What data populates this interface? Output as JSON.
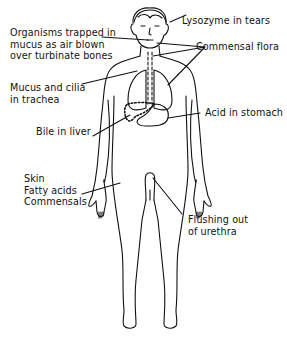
{
  "diagram": {
    "ink_color": "#111111",
    "background": "#ffffff",
    "labels": {
      "organisms": [
        "Organisms trapped in",
        "mucus as air blown",
        "over turbinate bones"
      ],
      "lysozyme": "Lysozyme in tears",
      "commensal_flora": "Commensal flora",
      "mucus_cilia": [
        "Mucus and cilia",
        "in trachea"
      ],
      "acid": "Acid in stomach",
      "bile": "Bile in liver",
      "skin": [
        "Skin",
        "Fatty acids",
        "Commensals"
      ],
      "flushing": [
        "Flushing out",
        "of urethra"
      ]
    }
  }
}
